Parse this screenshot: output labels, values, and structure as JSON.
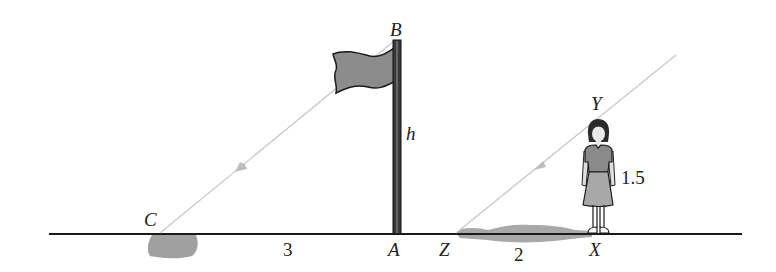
{
  "diagram": {
    "points": {
      "B": "B",
      "A": "A",
      "C": "C",
      "Y": "Y",
      "X": "X",
      "Z": "Z"
    },
    "measurements": {
      "pole_height": "h",
      "pole_shadow_length": "3",
      "person_height": "1.5",
      "person_shadow_length": "2"
    },
    "colors": {
      "ground_line": "#1a1a1a",
      "sun_ray": "#c8c8c8",
      "shadow": "#a0a0a0",
      "flag_fill": "#8c8c8c",
      "pole": "#3a3a3a",
      "person_shirt": "#8a8a8a",
      "person_skirt": "#a8a8a8"
    }
  }
}
